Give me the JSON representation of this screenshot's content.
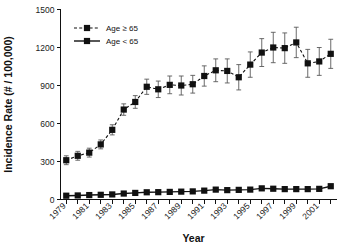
{
  "chart_data": {
    "type": "line",
    "title": "",
    "xlabel": "Year",
    "ylabel": "Incidence Rate (# / 100,000)",
    "xlim": [
      1978.5,
      2002.5
    ],
    "ylim": [
      0,
      1500
    ],
    "yticks": [
      0,
      300,
      600,
      900,
      1200,
      1500
    ],
    "ytick_labels": [
      "0",
      "300",
      "600",
      "900",
      "1200",
      "1500"
    ],
    "xticks": [
      1979,
      1980,
      1981,
      1982,
      1983,
      1984,
      1985,
      1986,
      1987,
      1988,
      1989,
      1990,
      1991,
      1992,
      1993,
      1994,
      1995,
      1996,
      1997,
      1998,
      1999,
      2000,
      2001,
      2002
    ],
    "xtick_labels_shown": [
      "1979",
      "1981",
      "1983",
      "1985",
      "1987",
      "1989",
      "1991",
      "1993",
      "1995",
      "1997",
      "1999",
      "2001"
    ],
    "grid": false,
    "legend_position": "top-left",
    "x": [
      1979,
      1980,
      1981,
      1982,
      1983,
      1984,
      1985,
      1986,
      1987,
      1988,
      1989,
      1990,
      1991,
      1992,
      1993,
      1994,
      1995,
      1996,
      1997,
      1998,
      1999,
      2000,
      2001,
      2002
    ],
    "series": [
      {
        "name": "Age ≥ 65",
        "marker": "square",
        "linestyle": "dashed",
        "color": "#111111",
        "values": [
          310,
          345,
          370,
          435,
          550,
          710,
          770,
          890,
          870,
          905,
          900,
          910,
          975,
          1020,
          1015,
          965,
          1065,
          1160,
          1200,
          1195,
          1240,
          1075,
          1090,
          1150
        ],
        "error_low": [
          275,
          310,
          335,
          400,
          510,
          665,
          720,
          830,
          805,
          835,
          825,
          840,
          895,
          930,
          920,
          865,
          965,
          1050,
          1080,
          1075,
          1120,
          965,
          980,
          1035
        ],
        "error_high": [
          345,
          380,
          405,
          470,
          590,
          755,
          820,
          950,
          935,
          975,
          975,
          980,
          1055,
          1110,
          1110,
          1065,
          1165,
          1270,
          1320,
          1315,
          1360,
          1185,
          1200,
          1265
        ]
      },
      {
        "name": "Age < 65",
        "marker": "square",
        "linestyle": "solid",
        "color": "#111111",
        "values": [
          30,
          32,
          35,
          37,
          40,
          47,
          52,
          57,
          58,
          60,
          62,
          64,
          70,
          78,
          74,
          76,
          78,
          88,
          85,
          82,
          82,
          82,
          84,
          105
        ],
        "error_low": null,
        "error_high": null
      }
    ],
    "legend": [
      {
        "label": "Age ≥ 65",
        "linestyle": "dashed",
        "marker": "square"
      },
      {
        "label": "Age < 65",
        "linestyle": "solid",
        "marker": "square"
      }
    ]
  },
  "axes": {
    "y_title": "Incidence Rate (# / 100,000)",
    "x_title": "Year"
  }
}
